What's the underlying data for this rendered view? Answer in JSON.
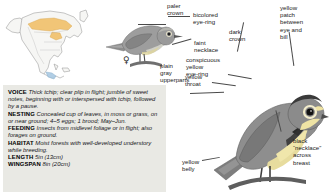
{
  "page": {
    "kind": "field-guide-species-page",
    "species_illustrated": "warbler"
  },
  "range_map": {
    "name": "north-america-range-map",
    "summer_color": "#f2c26b",
    "winter_color": "#a8c8e0",
    "outline_color": "#8a8a8a"
  },
  "female_plate": {
    "sex_symbol": "♀",
    "labels": [
      {
        "id": "paler-crown",
        "text": "paler\ncrown"
      },
      {
        "id": "bicolored-eye-ring",
        "text": "bicolored\neye-ring"
      },
      {
        "id": "faint-necklace",
        "text": "faint\nnecklace"
      }
    ]
  },
  "male_plate": {
    "labels": [
      {
        "id": "dark-crown",
        "text": "dark\ncrown"
      },
      {
        "id": "yellow-patch-between-eye-and-bill",
        "text": "yellow\npatch\nbetween\neye and\nbill"
      },
      {
        "id": "conspicuous-yellow-eye-ring",
        "text": "conspicuous\nyellow\neye-ring"
      },
      {
        "id": "yellow-throat",
        "text": "yellow\nthroat"
      },
      {
        "id": "plain-gray-upperparts",
        "text": "plain\ngray\nupperparts"
      },
      {
        "id": "black-necklace-across-breast",
        "text": "black\n“necklace”\nacross\nbreast"
      },
      {
        "id": "yellow-belly",
        "text": "yellow\nbelly"
      }
    ]
  },
  "facts": {
    "voice": {
      "heading": "VOICE",
      "body": "Thick tchip; clear plip in flight; jumble of sweet notes, beginning with or interspersed with tchip, followed by a pause."
    },
    "nesting": {
      "heading": "NESTING",
      "body": "Concealed cup of leaves, in moss or grass, on or near ground; 4–5 eggs; 1 brood; May–Jun."
    },
    "feeding": {
      "heading": "FEEDING",
      "body": "Insects from midlevel foliage or in flight; also forages on ground."
    },
    "habitat": {
      "heading": "HABITAT",
      "body": "Moist forests with well-developed understory while breeding."
    },
    "length": {
      "heading": "LENGTH",
      "body": "5in (13cm)"
    },
    "wingspan": {
      "heading": "WINGSPAN",
      "body": "8in (20cm)"
    }
  }
}
